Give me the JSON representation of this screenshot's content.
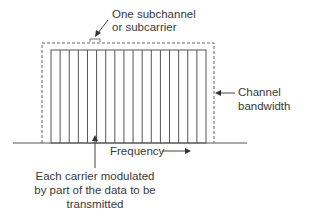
{
  "diagram": {
    "labels": {
      "subchannel_line1": "One subchannel",
      "subchannel_line2": "or subcarrier",
      "channel_line1": "Channel",
      "channel_line2": "bandwidth",
      "frequency": "Frequency",
      "carrier_line1": "Each carrier modulated",
      "carrier_line2": "by part of the data to be",
      "carrier_line3": "transmitted"
    },
    "subcarrier_count": 16,
    "colors": {
      "line": "#555555",
      "text": "#3a3a3a",
      "background": "#ffffff"
    }
  }
}
